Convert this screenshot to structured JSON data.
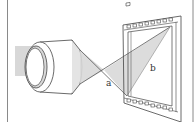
{
  "diagram": {
    "type": "lens-projection-onto-film",
    "labels": {
      "a": "a",
      "b": "b"
    },
    "colors": {
      "line": "#444444",
      "shade": "#d8d8d8",
      "frame": "#8a8a8a",
      "background": "#ffffff"
    }
  }
}
